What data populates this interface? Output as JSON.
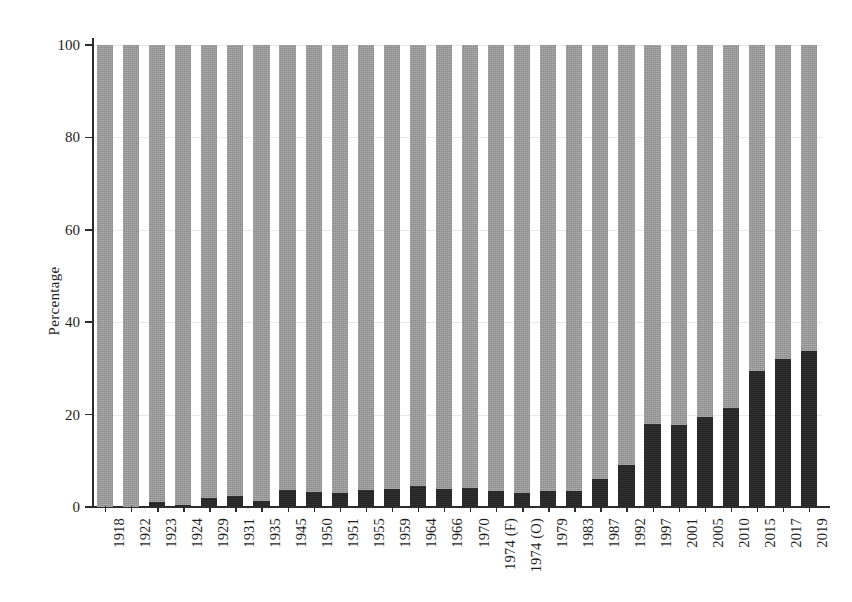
{
  "chart_data": {
    "type": "bar",
    "subtype": "stacked-100-percent",
    "title": "",
    "xlabel": "",
    "ylabel": "Percentage",
    "ylim": [
      0,
      100
    ],
    "yticks": [
      0,
      20,
      40,
      60,
      80,
      100
    ],
    "ytick_labels": [
      "0",
      "20",
      "40",
      "60",
      "80",
      "100"
    ],
    "grid": true,
    "grid_axis": "y",
    "legend": "none",
    "categories": [
      "1918",
      "1922",
      "1923",
      "1924",
      "1929",
      "1931",
      "1935",
      "1945",
      "1950",
      "1951",
      "1955",
      "1959",
      "1964",
      "1966",
      "1970",
      "1974 (F)",
      "1974 (O)",
      "1979",
      "1983",
      "1987",
      "1992",
      "1997",
      "2001",
      "2005",
      "2010",
      "2015",
      "2017",
      "2019"
    ],
    "series": [
      {
        "name": "Men",
        "color": "#9a9a9a",
        "stack_position": "top",
        "values": [
          100.0,
          100.0,
          98.9,
          99.5,
          98.0,
          97.7,
          98.7,
          96.3,
          96.7,
          97.0,
          96.3,
          96.0,
          95.5,
          96.0,
          95.9,
          96.5,
          97.0,
          96.5,
          96.5,
          94.0,
          91.0,
          82.0,
          82.2,
          80.5,
          78.5,
          70.5,
          68.0,
          66.2
        ]
      },
      {
        "name": "Women",
        "color": "#262626",
        "stack_position": "bottom",
        "values": [
          0.0,
          0.0,
          1.1,
          0.5,
          2.0,
          2.3,
          1.3,
          3.7,
          3.3,
          3.0,
          3.7,
          4.0,
          4.5,
          4.0,
          4.1,
          3.5,
          3.0,
          3.5,
          3.5,
          6.0,
          9.0,
          18.0,
          17.8,
          19.5,
          21.5,
          29.5,
          32.0,
          33.8
        ]
      }
    ]
  }
}
